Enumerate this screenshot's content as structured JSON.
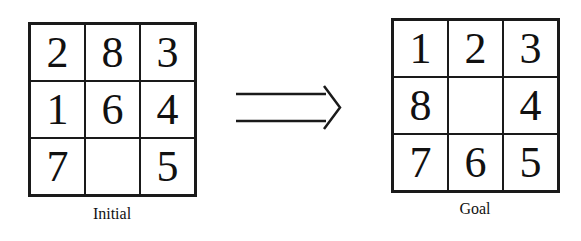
{
  "initial": {
    "label": "Initial",
    "cells": [
      "2",
      "8",
      "3",
      "1",
      "6",
      "4",
      "7",
      "",
      "5"
    ]
  },
  "goal": {
    "label": "Goal",
    "cells": [
      "1",
      "2",
      "3",
      "8",
      "",
      "4",
      "7",
      "6",
      "5"
    ]
  },
  "arrow": {
    "icon": "double-right-arrow-icon"
  }
}
